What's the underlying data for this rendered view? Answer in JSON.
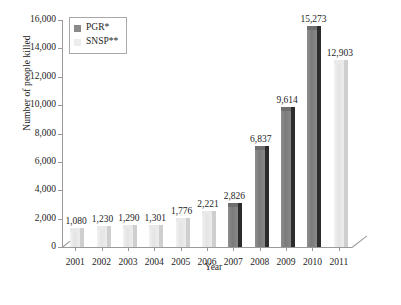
{
  "chart_data": {
    "type": "bar",
    "title": "",
    "xlabel": "Year",
    "ylabel": "Number of people killed",
    "categories": [
      "2001",
      "2002",
      "2003",
      "2004",
      "2005",
      "2006",
      "2007",
      "2008",
      "2009",
      "2010",
      "2011"
    ],
    "ylim": [
      0,
      16000
    ],
    "ytick_step": 2000,
    "ytick_labels": [
      "0",
      "2,000",
      "4,000",
      "6,000",
      "8,000",
      "10,000",
      "12,000",
      "14,000",
      "16,000"
    ],
    "ytick_values": [
      0,
      2000,
      4000,
      6000,
      8000,
      10000,
      12000,
      14000,
      16000
    ],
    "grid": false,
    "legend_position": "top-left",
    "series": [
      {
        "name": "PGR*",
        "color": "#8a8a8a",
        "values": [
          null,
          null,
          null,
          null,
          null,
          null,
          2826,
          6837,
          9614,
          15273,
          null
        ]
      },
      {
        "name": "SNSP**",
        "color": "#ededed",
        "values": [
          1080,
          1230,
          1290,
          1301,
          1776,
          2221,
          null,
          null,
          null,
          null,
          12903
        ]
      }
    ],
    "bars": [
      {
        "category": "2001",
        "series": "SNSP**",
        "value": 1080,
        "label": "1,080"
      },
      {
        "category": "2002",
        "series": "SNSP**",
        "value": 1230,
        "label": "1,230"
      },
      {
        "category": "2003",
        "series": "SNSP**",
        "value": 1290,
        "label": "1,290"
      },
      {
        "category": "2004",
        "series": "SNSP**",
        "value": 1301,
        "label": "1,301"
      },
      {
        "category": "2005",
        "series": "SNSP**",
        "value": 1776,
        "label": "1,776"
      },
      {
        "category": "2006",
        "series": "SNSP**",
        "value": 2221,
        "label": "2,221"
      },
      {
        "category": "2007",
        "series": "PGR*",
        "value": 2826,
        "label": "2,826"
      },
      {
        "category": "2008",
        "series": "PGR*",
        "value": 6837,
        "label": "6,837"
      },
      {
        "category": "2009",
        "series": "PGR*",
        "value": 9614,
        "label": "9,614"
      },
      {
        "category": "2010",
        "series": "PGR*",
        "value": 15273,
        "label": "15,273"
      },
      {
        "category": "2011",
        "series": "SNSP**",
        "value": 12903,
        "label": "12,903"
      }
    ]
  },
  "legend": {
    "entries": [
      {
        "label": "PGR*",
        "swatch": "pgr"
      },
      {
        "label": "SNSP**",
        "swatch": "snsp"
      }
    ]
  },
  "axes": {
    "y_title": "Number of people killed",
    "x_title": "Year"
  }
}
